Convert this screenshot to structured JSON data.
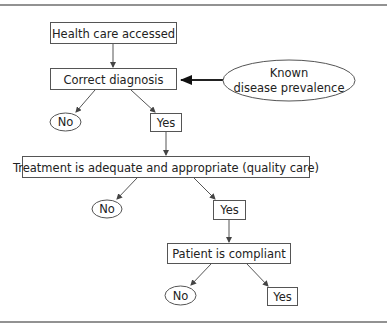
{
  "diagram": {
    "type": "flowchart",
    "nodes": {
      "health_care_accessed": {
        "label": "Health care accessed",
        "shape": "rectangle"
      },
      "correct_diagnosis": {
        "label": "Correct diagnosis",
        "shape": "rectangle"
      },
      "known_disease_prevalence": {
        "line1": "Known",
        "line2": "disease prevalence",
        "shape": "ellipse"
      },
      "diagnosis_no": {
        "label": "No",
        "shape": "ellipse"
      },
      "diagnosis_yes": {
        "label": "Yes",
        "shape": "rectangle"
      },
      "treatment_adequate": {
        "label": "Treatment is adequate and appropriate (quality care)",
        "shape": "rectangle"
      },
      "treatment_no": {
        "label": "No",
        "shape": "ellipse"
      },
      "treatment_yes": {
        "label": "Yes",
        "shape": "rectangle"
      },
      "patient_compliant": {
        "label": "Patient is compliant",
        "shape": "rectangle"
      },
      "compliant_no": {
        "label": "No",
        "shape": "ellipse"
      },
      "compliant_yes": {
        "label": "Yes",
        "shape": "rectangle"
      }
    },
    "edges": [
      {
        "from": "health_care_accessed",
        "to": "correct_diagnosis"
      },
      {
        "from": "known_disease_prevalence",
        "to": "correct_diagnosis",
        "style": "bold"
      },
      {
        "from": "correct_diagnosis",
        "to": "diagnosis_no"
      },
      {
        "from": "correct_diagnosis",
        "to": "diagnosis_yes"
      },
      {
        "from": "diagnosis_yes",
        "to": "treatment_adequate"
      },
      {
        "from": "treatment_adequate",
        "to": "treatment_no"
      },
      {
        "from": "treatment_adequate",
        "to": "treatment_yes"
      },
      {
        "from": "treatment_yes",
        "to": "patient_compliant"
      },
      {
        "from": "patient_compliant",
        "to": "compliant_no"
      },
      {
        "from": "patient_compliant",
        "to": "compliant_yes"
      }
    ]
  }
}
